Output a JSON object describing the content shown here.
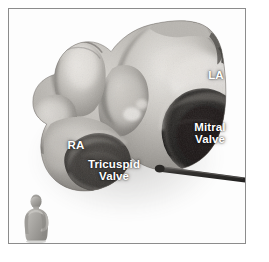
{
  "figure": {
    "type": "anatomical-photograph",
    "modality": "greyscale cadaveric photograph",
    "background_color": "#ffffff",
    "frame_color": "#8c8c8c"
  },
  "labels": {
    "la": "LA",
    "ra": "RA",
    "mitral_valve": "Mitral\nValve",
    "tricuspid_valve": "Tricuspid\nValve",
    "text_color": "#ffffff"
  },
  "structures": [
    {
      "name": "left-atrium",
      "abbrev": "LA",
      "label": "LA"
    },
    {
      "name": "right-atrium",
      "abbrev": "RA",
      "label": "RA"
    },
    {
      "name": "mitral-valve",
      "abbrev": "MV",
      "label": "Mitral Valve"
    },
    {
      "name": "tricuspid-valve",
      "abbrev": "TV",
      "label": "Tricuspid Valve"
    },
    {
      "name": "probe",
      "abbrev": "",
      "label": ""
    }
  ],
  "scale_figure": {
    "name": "human-body-scale-reference",
    "description": "small grey three-dimensional human bust shown for orientation",
    "color": "#9a9a9a"
  }
}
